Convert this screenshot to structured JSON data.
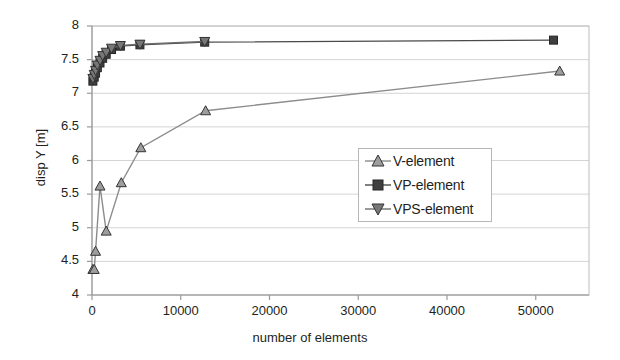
{
  "chart_data": {
    "type": "line",
    "title": "",
    "xlabel": "number of elements",
    "ylabel": "disp Y [m]",
    "xlim": [
      0,
      56000
    ],
    "ylim": [
      4,
      8
    ],
    "xticks": [
      0,
      10000,
      20000,
      30000,
      40000,
      50000
    ],
    "xtick_labels": [
      "0",
      "10000",
      "20000",
      "30000",
      "40000",
      "50000"
    ],
    "yticks": [
      4,
      4.5,
      5,
      5.5,
      6,
      6.5,
      7,
      7.5,
      8
    ],
    "ytick_labels": [
      "4",
      "4.5",
      "5",
      "5.5",
      "6",
      "6.5",
      "7",
      "7.5",
      "8"
    ],
    "grid": "horizontal",
    "legend_position": "center-right",
    "series": [
      {
        "name": "V-element",
        "marker": "triangle-up",
        "color": "#8c8c8c",
        "line_color": "#8c8c8c",
        "x": [
          100,
          250,
          400,
          900,
          1600,
          3300,
          5500,
          12800,
          52700
        ],
        "y": [
          4.38,
          4.38,
          4.65,
          5.62,
          4.95,
          5.67,
          6.19,
          6.74,
          7.33
        ]
      },
      {
        "name": "VP-element",
        "marker": "square",
        "color": "#3a3a3a",
        "line_color": "#4a4a4a",
        "x": [
          100,
          250,
          400,
          600,
          900,
          1200,
          1600,
          2200,
          3200,
          5400,
          12700,
          52000
        ],
        "y": [
          7.18,
          7.24,
          7.3,
          7.38,
          7.45,
          7.52,
          7.58,
          7.65,
          7.7,
          7.72,
          7.76,
          7.79
        ]
      },
      {
        "name": "VPS-element",
        "marker": "triangle-down",
        "color": "#6e6e6e",
        "line_color": "#6e6e6e",
        "x": [
          100,
          250,
          400,
          600,
          900,
          1200,
          1600,
          2200,
          3200,
          5400,
          12700
        ],
        "y": [
          7.22,
          7.28,
          7.34,
          7.42,
          7.49,
          7.56,
          7.61,
          7.67,
          7.71,
          7.73,
          7.77
        ]
      }
    ]
  },
  "legend": {
    "items": [
      {
        "label": "V-element",
        "marker": "triangle-up-icon"
      },
      {
        "label": "VP-element",
        "marker": "square-icon"
      },
      {
        "label": "VPS-element",
        "marker": "triangle-down-icon"
      }
    ]
  },
  "axes": {
    "y_title": "disp Y [m]",
    "x_title": "number of elements"
  }
}
